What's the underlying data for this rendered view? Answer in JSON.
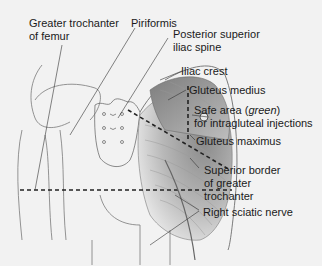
{
  "diagram": {
    "labels": {
      "greater_trochanter_line1": "Greater trochanter",
      "greater_trochanter_line2": "of femur",
      "piriformis": "Piriformis",
      "psis_line1": "Posterior superior",
      "psis_line2": "iliac spine",
      "iliac_crest": "Iliac crest",
      "gluteus_medius": "Gluteus medius",
      "safe_area_prefix": "Safe area (",
      "safe_area_color": "green",
      "safe_area_suffix": ")",
      "safe_area_line2": "for intragluteal injections",
      "gluteus_maximus": "Gluteus maximus",
      "superior_border_line1": "Superior border",
      "superior_border_line2": "of greater",
      "superior_border_line3": "trochanter",
      "sciatic_nerve": "Right sciatic nerve"
    },
    "colors": {
      "background": "#f2f2f2",
      "outline": "#6e6e6e",
      "muscle_dark": "#6a6a6a",
      "muscle_light": "#d4d4d4",
      "leader_line": "#333333",
      "dashed_line": "#222222"
    }
  }
}
